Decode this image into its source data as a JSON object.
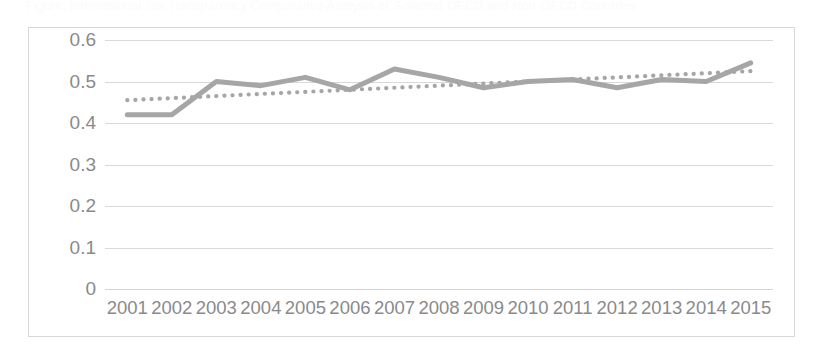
{
  "bleed_text": "Figure: International Tax Transparency Comparative Analysis of Selected OECD and Non-OECD Countries",
  "chart_data": {
    "type": "line",
    "title": "",
    "xlabel": "",
    "ylabel": "",
    "ylim": [
      0,
      0.6
    ],
    "yticks": [
      "0.6",
      "0.5",
      "0.4",
      "0.3",
      "0.2",
      "0.1",
      "0"
    ],
    "ytick_values": [
      0.6,
      0.5,
      0.4,
      0.3,
      0.2,
      0.1,
      0
    ],
    "grid": true,
    "legend": "none",
    "categories": [
      "2001",
      "2002",
      "2003",
      "2004",
      "2005",
      "2006",
      "2007",
      "2008",
      "2009",
      "2010",
      "2011",
      "2012",
      "2013",
      "2014",
      "2015"
    ],
    "series": [
      {
        "name": "Series 1",
        "style": "solid",
        "color": "#a6a6a6",
        "values": [
          0.42,
          0.42,
          0.5,
          0.49,
          0.51,
          0.48,
          0.53,
          0.51,
          0.485,
          0.5,
          0.505,
          0.485,
          0.505,
          0.5,
          0.545
        ]
      },
      {
        "name": "Trendline",
        "style": "dotted",
        "color": "#a6a6a6",
        "values": [
          0.455,
          0.46,
          0.465,
          0.47,
          0.475,
          0.48,
          0.485,
          0.49,
          0.495,
          0.5,
          0.505,
          0.51,
          0.515,
          0.52,
          0.525
        ]
      }
    ]
  },
  "colors": {
    "series_line": "#a6a6a6",
    "gridline": "#d9d9d9",
    "border": "#d8d8d8",
    "tick_label": "#8a8a8a",
    "background": "#ffffff"
  }
}
